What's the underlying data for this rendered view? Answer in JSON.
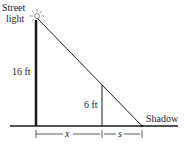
{
  "diagram": {
    "type": "similar-triangles",
    "labels": {
      "street_light_line1": "Street",
      "street_light_line2": "light",
      "pole_height": "16 ft",
      "person_height": "6 ft",
      "shadow": "Shadow",
      "distance_x": "x",
      "distance_s": "s"
    },
    "icons": {
      "light": "sun-burst-icon"
    },
    "colors": {
      "line": "#1a1a1a",
      "background": "#ffffff"
    }
  }
}
